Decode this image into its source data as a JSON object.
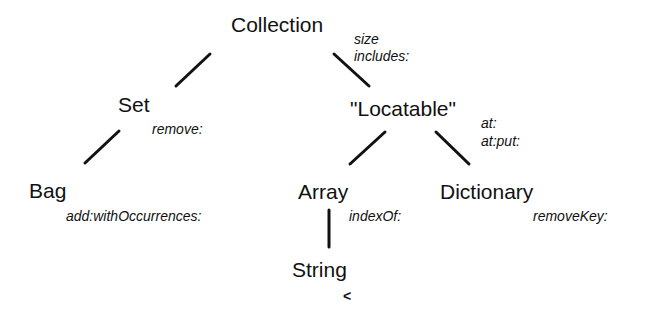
{
  "diagram": {
    "nodes": {
      "collection": {
        "label": "Collection",
        "methods": [
          "size",
          "includes:"
        ]
      },
      "set": {
        "label": "Set",
        "methods": [
          "remove:"
        ]
      },
      "locatable": {
        "label": "\"Locatable\"",
        "methods": [
          "at:",
          "at:put:"
        ]
      },
      "bag": {
        "label": "Bag",
        "methods": [
          "add:withOccurrences:"
        ]
      },
      "array": {
        "label": "Array",
        "methods": [
          "indexOf:"
        ]
      },
      "dictionary": {
        "label": "Dictionary",
        "methods": [
          "removeKey:"
        ]
      },
      "string": {
        "label": "String",
        "methods": [
          "<"
        ]
      }
    },
    "edges": [
      {
        "from": "collection",
        "to": "set"
      },
      {
        "from": "collection",
        "to": "locatable"
      },
      {
        "from": "set",
        "to": "bag"
      },
      {
        "from": "locatable",
        "to": "array"
      },
      {
        "from": "locatable",
        "to": "dictionary"
      },
      {
        "from": "array",
        "to": "string"
      }
    ],
    "colors": {
      "ink": "#111111",
      "background": "#ffffff"
    }
  }
}
